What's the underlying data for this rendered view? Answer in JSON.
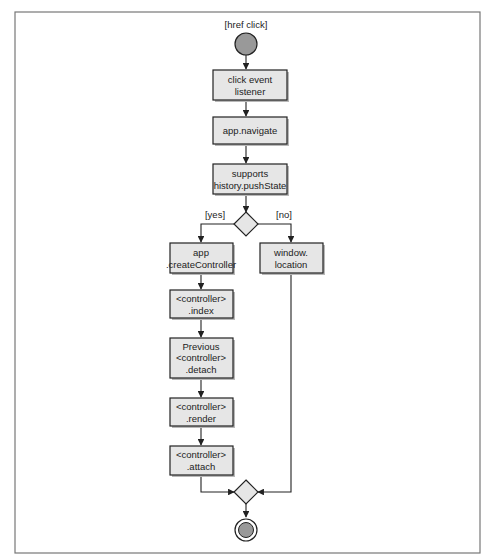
{
  "diagram": {
    "type": "UML activity diagram",
    "colors": {
      "box_fill": "#e6e6e6",
      "box_stroke": "#222222",
      "node_fill": "#999999",
      "frame_stroke": "#777777"
    },
    "start": {
      "label": "[href click]"
    },
    "nodes": [
      {
        "id": "n1",
        "lines": [
          "click event",
          "listener"
        ]
      },
      {
        "id": "n2",
        "lines": [
          "app.navigate"
        ]
      },
      {
        "id": "n3",
        "lines": [
          "supports",
          "history.pushState"
        ]
      },
      {
        "id": "n4",
        "lines": [
          "app",
          ".createController"
        ]
      },
      {
        "id": "n5",
        "lines": [
          "window.",
          "location"
        ]
      },
      {
        "id": "n6",
        "lines": [
          "<controller>",
          ".index"
        ]
      },
      {
        "id": "n7",
        "lines": [
          "Previous",
          "<controller>",
          ".detach"
        ]
      },
      {
        "id": "n8",
        "lines": [
          "<controller>",
          ".render"
        ]
      },
      {
        "id": "n9",
        "lines": [
          "<controller>",
          ".attach"
        ]
      }
    ],
    "guards": {
      "yes": "[yes]",
      "no": "[no]"
    },
    "edges": [
      [
        "start",
        "n1"
      ],
      [
        "n1",
        "n2"
      ],
      [
        "n2",
        "n3"
      ],
      [
        "n3",
        "decision"
      ],
      [
        "decision",
        "n4",
        "[yes]"
      ],
      [
        "decision",
        "n5",
        "[no]"
      ],
      [
        "n4",
        "n6"
      ],
      [
        "n6",
        "n7"
      ],
      [
        "n7",
        "n8"
      ],
      [
        "n8",
        "n9"
      ],
      [
        "n9",
        "merge"
      ],
      [
        "n5",
        "merge"
      ],
      [
        "merge",
        "end"
      ]
    ]
  }
}
